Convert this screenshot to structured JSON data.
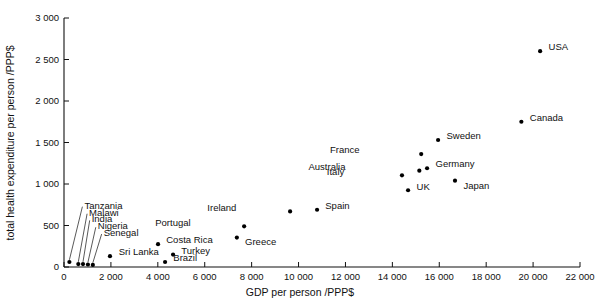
{
  "chart_data": {
    "type": "scatter",
    "title": "",
    "xlabel": "GDP per person /PPP$",
    "ylabel": "total health expenditure per person /PPP$",
    "xlim": [
      0,
      22000
    ],
    "ylim": [
      0,
      3000
    ],
    "grid": false,
    "legend": "none",
    "xticks": [
      "0",
      "2 000",
      "4 000",
      "6 000",
      "8 000",
      "10 000",
      "12 000",
      "14 000",
      "16 000",
      "18 000",
      "20 000",
      "22 000"
    ],
    "xtick_values": [
      0,
      2000,
      4000,
      6000,
      8000,
      10000,
      12000,
      14000,
      16000,
      18000,
      20000,
      22000
    ],
    "yticks": [
      "0",
      "500",
      "1 000",
      "1 500",
      "2 000",
      "2 500",
      "3 000"
    ],
    "ytick_values": [
      0,
      500,
      1000,
      1500,
      2000,
      2500,
      3000
    ],
    "points": [
      {
        "label": "Tanzania",
        "x": 230,
        "y": 60,
        "label_x": 870,
        "label_y": 745,
        "leader": true
      },
      {
        "label": "Malawi",
        "x": 610,
        "y": 35,
        "label_x": 1070,
        "label_y": 660,
        "leader": true
      },
      {
        "label": "India",
        "x": 810,
        "y": 35,
        "label_x": 1180,
        "label_y": 580,
        "leader": true
      },
      {
        "label": "Nigeria",
        "x": 1020,
        "y": 30,
        "label_x": 1440,
        "label_y": 497,
        "leader": true
      },
      {
        "label": "Senegal",
        "x": 1230,
        "y": 25,
        "label_x": 1690,
        "label_y": 415,
        "leader": true
      },
      {
        "label": "Sri Lanka",
        "x": 1960,
        "y": 130,
        "label_x": 2330,
        "label_y": 182,
        "leader": false
      },
      {
        "label": "Costa Rica",
        "x": 4010,
        "y": 275,
        "label_x": 4360,
        "label_y": 325,
        "leader": false
      },
      {
        "label": "Turkey",
        "x": 4650,
        "y": 150,
        "label_x": 5000,
        "label_y": 200,
        "leader": false
      },
      {
        "label": "Brazil",
        "x": 4310,
        "y": 60,
        "label_x": 4660,
        "label_y": 110,
        "leader": false
      },
      {
        "label": "Greece",
        "x": 7370,
        "y": 355,
        "label_x": 7720,
        "label_y": 305,
        "leader": false
      },
      {
        "label": "Portugal",
        "x": 7680,
        "y": 490,
        "label_x": 5400,
        "label_y": 535,
        "leader": false
      },
      {
        "label": "Ireland",
        "x": 9640,
        "y": 670,
        "label_x": 7350,
        "label_y": 720,
        "leader": false
      },
      {
        "label": "Spain",
        "x": 10790,
        "y": 690,
        "label_x": 11140,
        "label_y": 738,
        "leader": false
      },
      {
        "label": "Italy",
        "x": 14410,
        "y": 1105,
        "label_x": 11950,
        "label_y": 1150,
        "leader": false
      },
      {
        "label": "UK",
        "x": 14670,
        "y": 925,
        "label_x": 15030,
        "label_y": 972,
        "leader": false
      },
      {
        "label": "Australia",
        "x": 15150,
        "y": 1160,
        "label_x": 12000,
        "label_y": 1210,
        "leader": false
      },
      {
        "label": "France",
        "x": 15230,
        "y": 1360,
        "label_x": 12600,
        "label_y": 1410,
        "leader": false
      },
      {
        "label": "Germany",
        "x": 15480,
        "y": 1190,
        "label_x": 15840,
        "label_y": 1240,
        "leader": false
      },
      {
        "label": "Sweden",
        "x": 15950,
        "y": 1530,
        "label_x": 16310,
        "label_y": 1580,
        "leader": false
      },
      {
        "label": "Japan",
        "x": 16670,
        "y": 1040,
        "label_x": 17030,
        "label_y": 985,
        "leader": false
      },
      {
        "label": "Canada",
        "x": 19500,
        "y": 1750,
        "label_x": 19860,
        "label_y": 1800,
        "leader": false
      },
      {
        "label": "USA",
        "x": 20300,
        "y": 2600,
        "label_x": 20660,
        "label_y": 2650,
        "leader": false
      }
    ]
  }
}
